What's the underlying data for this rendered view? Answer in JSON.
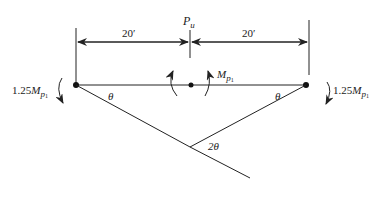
{
  "figure": {
    "type": "beam-collapse-mechanism",
    "load": {
      "symbol": "P",
      "subscript": "u"
    },
    "spans": [
      {
        "label": "20′"
      },
      {
        "label": "20′"
      }
    ],
    "moments": {
      "left_end": {
        "coef": "1.25",
        "symbol": "M",
        "sub": "p",
        "subsub": "1"
      },
      "right_end": {
        "coef": "1.25",
        "symbol": "M",
        "sub": "p",
        "subsub": "1"
      },
      "center": {
        "symbol": "M",
        "sub": "p",
        "subsub": "1"
      }
    },
    "angles": {
      "left": "θ",
      "right": "θ",
      "center": "2θ"
    }
  },
  "colors": {
    "line": "#222222",
    "background": "#ffffff"
  }
}
